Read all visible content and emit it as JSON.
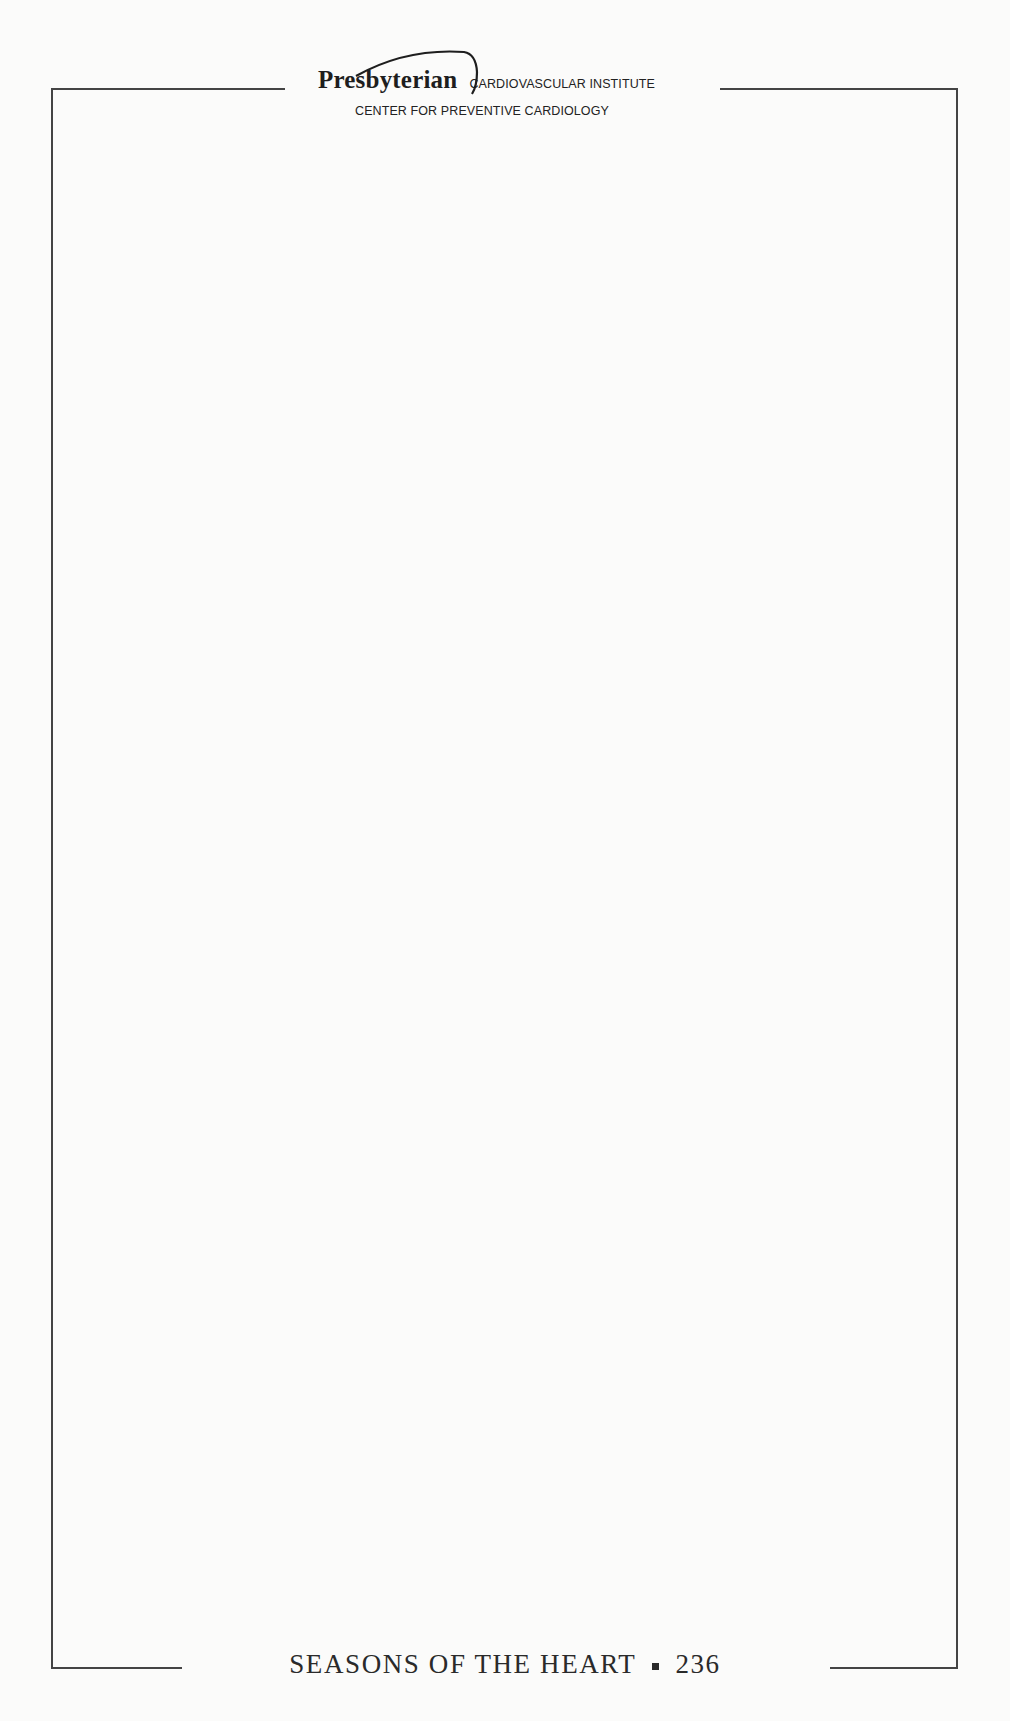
{
  "header": {
    "organization": "Presbyterian",
    "institute": "CARDIOVASCULAR INSTITUTE",
    "center": "CENTER FOR PREVENTIVE CARDIOLOGY"
  },
  "notes_area": {
    "content": ""
  },
  "footer": {
    "book_title": "SEASONS OF THE HEART",
    "separator": "bullet-square",
    "page_number": "236"
  },
  "colors": {
    "frame": "#444444",
    "text": "#222222",
    "paper": "#fbfbfa"
  }
}
